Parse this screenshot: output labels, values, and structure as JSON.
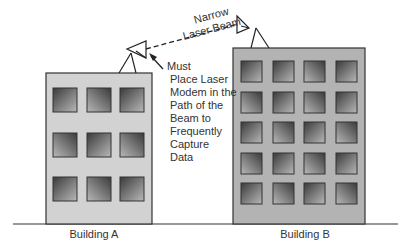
{
  "diagram": {
    "beam_label_line1": "Narrow",
    "beam_label_line2": "Laser Beam",
    "note_lines": [
      "Must",
      "Place Laser",
      "Modem in the",
      "Path of the",
      "Beam to",
      "Frequently",
      "Capture",
      "Data"
    ],
    "building_a_label": "Building A",
    "building_b_label": "Building B",
    "building_a": {
      "floors": 3,
      "columns": 3
    },
    "building_b": {
      "floors": 5,
      "columns": 4
    },
    "colors": {
      "building_a_fill": "#d2d2d2",
      "building_b_fill": "#b3b3b3",
      "outline": "#333333",
      "window_dark": "#3a3a3a",
      "window_light": "#bdbdbd"
    }
  }
}
